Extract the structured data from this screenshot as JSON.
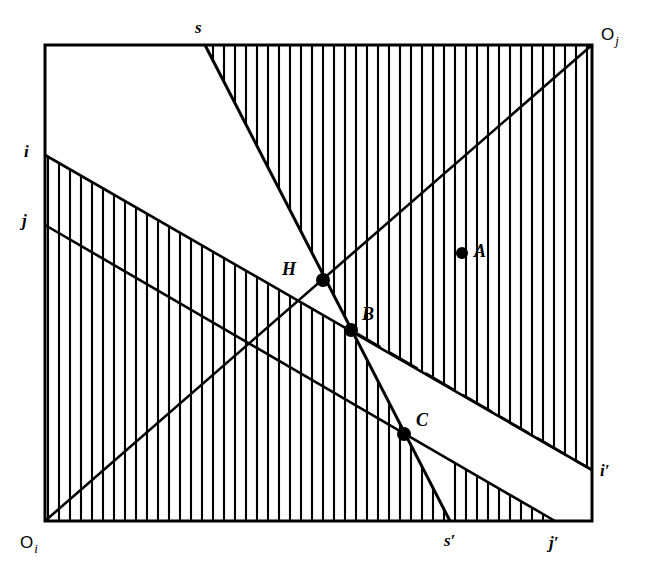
{
  "figure": {
    "box": {
      "left": 45,
      "top": 45,
      "right": 592,
      "bottom": 521,
      "stroke_color": "#000000"
    },
    "corners": [
      {
        "name": "origin-i",
        "base": "O",
        "sub": "i",
        "x": 20,
        "y": 548
      },
      {
        "name": "origin-j",
        "base": "O",
        "sub": "j",
        "x": 601,
        "y": 40
      }
    ],
    "axis_labels": [
      {
        "name": "label-s",
        "text": "s",
        "x": 195,
        "y": 33,
        "prime": false
      },
      {
        "name": "label-i",
        "text": "i",
        "x": 24,
        "y": 157,
        "prime": false
      },
      {
        "name": "label-j",
        "text": "j",
        "x": 22,
        "y": 226,
        "prime": false
      },
      {
        "name": "label-i-prime",
        "text": "i′",
        "x": 600,
        "y": 476,
        "prime": true
      },
      {
        "name": "label-s-prime",
        "text": "s′",
        "x": 444,
        "y": 546,
        "prime": true
      },
      {
        "name": "label-j-prime",
        "text": "j′",
        "x": 549,
        "y": 548,
        "prime": true
      }
    ],
    "points": [
      {
        "name": "point-H",
        "label": "H",
        "x": 323,
        "y": 280,
        "label_dx": -27,
        "label_dy": -5,
        "r": 7
      },
      {
        "name": "point-B",
        "label": "B",
        "x": 351,
        "y": 330,
        "label_dx": 11,
        "label_dy": -10,
        "r": 7
      },
      {
        "name": "point-C",
        "label": "C",
        "x": 404,
        "y": 434,
        "label_dx": 12,
        "label_dy": -8,
        "r": 7
      },
      {
        "name": "point-A",
        "label": "A",
        "x": 462,
        "y": 253,
        "label_dx": 12,
        "label_dy": 4,
        "r": 6
      }
    ],
    "lines": [
      {
        "name": "line-s",
        "from_label": "s",
        "to_label": "s′",
        "x1": 205,
        "y1": 45,
        "x2": 450,
        "y2": 521
      },
      {
        "name": "line-i",
        "from_label": "i",
        "to_label": "i′",
        "x1": 45,
        "y1": 155,
        "x2": 592,
        "y2": 470,
        "dashed_tail": true
      },
      {
        "name": "line-j",
        "from_label": "j",
        "to_label": "j′",
        "x1": 45,
        "y1": 225,
        "x2": 555,
        "y2": 521
      },
      {
        "name": "line-diagonal",
        "from_label": "O_i",
        "to_label": "O_j",
        "x1": 45,
        "y1": 521,
        "x2": 592,
        "y2": 45
      }
    ],
    "hatched_regions": [
      {
        "name": "hatch-region-upper-right",
        "description": "region right of line s and above line i', vertical hatching"
      },
      {
        "name": "hatch-region-lower-left",
        "description": "region below line i and left of line s', vertical hatching"
      }
    ],
    "hatch": {
      "spacing": 11,
      "stroke_width": 2.1,
      "orientation": "vertical"
    }
  }
}
